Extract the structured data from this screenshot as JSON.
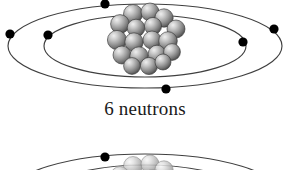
{
  "figure": {
    "background_color": "#ffffff",
    "caption": "6 neutrons",
    "caption_color": "#1a1a1a",
    "orbit_color": "#404040",
    "electron_color": "#000000",
    "nucleus_color": "#8c8c8c",
    "nucleus_highlight_color": "#e2e2e2",
    "nucleus_shadow_color": "#4a4a4a",
    "nucleus_outline_color": "#3a3a3a"
  },
  "top_diagram": {
    "label": "carbon-atom-bohr-model",
    "orbits": [
      {
        "name": "outer-orbit",
        "cx": 145,
        "cy": 46,
        "rx": 137,
        "ry": 42
      },
      {
        "name": "inner-orbit",
        "cx": 145,
        "cy": 46,
        "rx": 101,
        "ry": 31
      }
    ],
    "electrons": [
      {
        "name": "electron-inner-top",
        "x": 105,
        "y": 4,
        "r": 4.6
      },
      {
        "name": "electron-outer-left",
        "x": 10,
        "y": 34,
        "r": 4.6
      },
      {
        "name": "electron-inner-left",
        "x": 48,
        "y": 35,
        "r": 4.6
      },
      {
        "name": "electron-outer-right",
        "x": 274,
        "y": 29,
        "r": 4.6
      },
      {
        "name": "electron-inner-right",
        "x": 243,
        "y": 42,
        "r": 4.6
      },
      {
        "name": "electron-outer-bottom",
        "x": 166,
        "y": 89,
        "r": 4.6
      }
    ],
    "electron_count": 6,
    "nucleus": {
      "name": "nucleus-cluster",
      "cx": 145,
      "cy": 40,
      "rx": 31,
      "ry": 33,
      "particle_count": 18,
      "particles": [
        {
          "cx": 133,
          "cy": 14,
          "r": 9.5
        },
        {
          "cx": 150,
          "cy": 12,
          "r": 9.0
        },
        {
          "cx": 164,
          "cy": 18,
          "r": 9.2
        },
        {
          "cx": 120,
          "cy": 24,
          "r": 9.4
        },
        {
          "cx": 176,
          "cy": 29,
          "r": 9.0
        },
        {
          "cx": 136,
          "cy": 28,
          "r": 8.8
        },
        {
          "cx": 153,
          "cy": 26,
          "r": 8.6
        },
        {
          "cx": 117,
          "cy": 40,
          "r": 9.6
        },
        {
          "cx": 134,
          "cy": 42,
          "r": 9.2
        },
        {
          "cx": 152,
          "cy": 40,
          "r": 9.0
        },
        {
          "cx": 168,
          "cy": 41,
          "r": 9.3
        },
        {
          "cx": 122,
          "cy": 55,
          "r": 9.0
        },
        {
          "cx": 139,
          "cy": 56,
          "r": 9.2
        },
        {
          "cx": 157,
          "cy": 54,
          "r": 8.8
        },
        {
          "cx": 172,
          "cy": 52,
          "r": 8.4
        },
        {
          "cx": 132,
          "cy": 66,
          "r": 8.4
        },
        {
          "cx": 149,
          "cy": 66,
          "r": 8.6
        },
        {
          "cx": 163,
          "cy": 62,
          "r": 8.0
        }
      ]
    }
  },
  "bottom_diagram": {
    "label": "second-atom-bohr-model-cropped",
    "orbits": [
      {
        "name": "outer-orbit-partial",
        "cx": 145,
        "cy": 196,
        "rx": 137,
        "ry": 42
      },
      {
        "name": "inner-orbit-partial",
        "cx": 145,
        "cy": 196,
        "rx": 101,
        "ry": 31
      }
    ],
    "electrons": [
      {
        "name": "electron-inner-top-partial",
        "x": 105,
        "y": 157,
        "r": 4.6
      }
    ],
    "nucleus": {
      "name": "nucleus-cluster-partial",
      "cx": 145,
      "cy": 192,
      "rx": 31,
      "ry": 33,
      "particles": [
        {
          "cx": 133,
          "cy": 166,
          "r": 9.5
        },
        {
          "cx": 150,
          "cy": 164,
          "r": 9.0
        },
        {
          "cx": 164,
          "cy": 170,
          "r": 9.2
        },
        {
          "cx": 120,
          "cy": 176,
          "r": 9.4
        },
        {
          "cx": 176,
          "cy": 181,
          "r": 9.0
        },
        {
          "cx": 136,
          "cy": 180,
          "r": 8.8
        },
        {
          "cx": 153,
          "cy": 178,
          "r": 8.6
        }
      ]
    }
  }
}
